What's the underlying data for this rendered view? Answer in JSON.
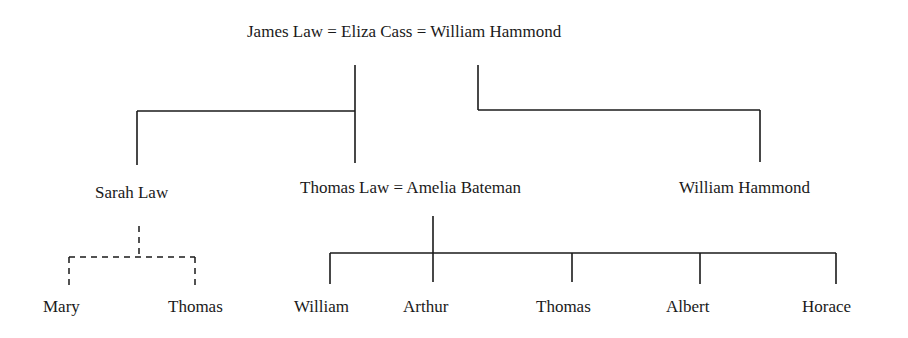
{
  "generation1": {
    "label": "James Law = Eliza Cass = William Hammond",
    "members": [
      "James Law",
      "Eliza Cass",
      "William Hammond"
    ]
  },
  "generation2": {
    "sarah": "Sarah Law",
    "thomas_couple": "Thomas Law = Amelia Bateman",
    "william": "William Hammond"
  },
  "generation3": {
    "sarah_children": [
      "Mary",
      "Thomas"
    ],
    "thomas_children": [
      "William",
      "Arthur",
      "Thomas",
      "Albert",
      "Horace"
    ]
  },
  "colors": {
    "line": "#1a1a1a",
    "text": "#1a1a1a",
    "background": "#ffffff"
  }
}
